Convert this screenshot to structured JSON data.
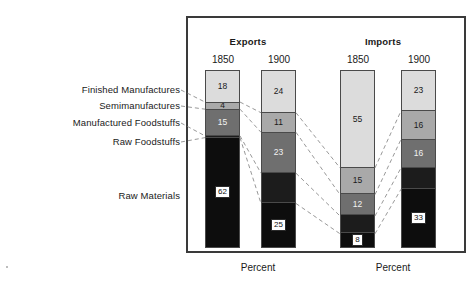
{
  "chart_data": {
    "type": "bar",
    "subtype": "stacked-bar",
    "title": "",
    "xlabel": "",
    "ylabel": "",
    "unit": "Percent",
    "ylim": [
      0,
      100
    ],
    "grid": false,
    "legend": "left-callout-labels",
    "categories": [
      "Exports 1850",
      "Exports 1900",
      "Imports 1850",
      "Imports 1900"
    ],
    "groups": [
      {
        "name": "Exports",
        "years": [
          "1850",
          "1900"
        ]
      },
      {
        "name": "Imports",
        "years": [
          "1850",
          "1900"
        ]
      }
    ],
    "series": [
      {
        "name": "Finished Manufactures",
        "values": [
          18,
          24,
          55,
          23
        ]
      },
      {
        "name": "Semimanufactures",
        "values": [
          4,
          11,
          15,
          16
        ]
      },
      {
        "name": "Manufactured Foodstuffs",
        "values": [
          15,
          23,
          12,
          16
        ]
      },
      {
        "name": "Raw Foodstuffs",
        "values": [
          1,
          17,
          10,
          12
        ]
      },
      {
        "name": "Raw Materials",
        "values": [
          62,
          25,
          8,
          33
        ]
      }
    ],
    "colors": {
      "finished_manufactures": "#dcdcdc",
      "semimanufactures": "#a9a9a9",
      "manufactured_foodstuffs": "#6f6f6f",
      "raw_foodstuffs": "#1c1c1c",
      "raw_materials": "#0d0d0d",
      "frame": "#3a3a3a",
      "connector": "#7d7d7d",
      "background": "#ffffff"
    }
  },
  "headers": {
    "exports": "Exports",
    "imports": "Imports",
    "exports_1850": "1850",
    "exports_1900": "1900",
    "imports_1850": "1850",
    "imports_1900": "1900"
  },
  "category_labels": [
    {
      "key": "finished-manufactures",
      "text": "Finished Manufactures"
    },
    {
      "key": "semimanufactures",
      "text": "Semimanufactures"
    },
    {
      "key": "manufactured-foodstuffs",
      "text": "Manufactured Foodstuffs"
    },
    {
      "key": "raw-foodstuffs",
      "text": "Raw Foodstuffs"
    },
    {
      "key": "raw-materials",
      "text": "Raw Materials"
    }
  ],
  "bars": {
    "exports_1850": {
      "year": "1850",
      "segments": [
        {
          "label": "Finished Manufactures",
          "value": "18",
          "pct": 18
        },
        {
          "label": "Semimanufactures",
          "value": "4",
          "pct": 4
        },
        {
          "label": "Manufactured Foodstuffs",
          "value": "15",
          "pct": 15
        },
        {
          "label": "Raw Foodstuffs",
          "value": "",
          "pct": 1
        },
        {
          "label": "Raw Materials",
          "value": "62",
          "pct": 62
        }
      ]
    },
    "exports_1900": {
      "year": "1900",
      "segments": [
        {
          "label": "Finished Manufactures",
          "value": "24",
          "pct": 24
        },
        {
          "label": "Semimanufactures",
          "value": "11",
          "pct": 11
        },
        {
          "label": "Manufactured Foodstuffs",
          "value": "23",
          "pct": 23
        },
        {
          "label": "Raw Foodstuffs",
          "value": "",
          "pct": 17
        },
        {
          "label": "Raw Materials",
          "value": "25",
          "pct": 25
        }
      ]
    },
    "imports_1850": {
      "year": "1850",
      "segments": [
        {
          "label": "Finished Manufactures",
          "value": "55",
          "pct": 55
        },
        {
          "label": "Semimanufactures",
          "value": "15",
          "pct": 15
        },
        {
          "label": "Manufactured Foodstuffs",
          "value": "12",
          "pct": 12
        },
        {
          "label": "Raw Foodstuffs",
          "value": "",
          "pct": 10
        },
        {
          "label": "Raw Materials",
          "value": "8",
          "pct": 8
        }
      ]
    },
    "imports_1900": {
      "year": "1900",
      "segments": [
        {
          "label": "Finished Manufactures",
          "value": "23",
          "pct": 23
        },
        {
          "label": "Semimanufactures",
          "value": "16",
          "pct": 16
        },
        {
          "label": "Manufactured Foodstuffs",
          "value": "16",
          "pct": 16
        },
        {
          "label": "Raw Foodstuffs",
          "value": "",
          "pct": 12
        },
        {
          "label": "Raw Materials",
          "value": "33",
          "pct": 33
        }
      ]
    }
  },
  "captions": {
    "left": "Percent",
    "right": "Percent"
  }
}
